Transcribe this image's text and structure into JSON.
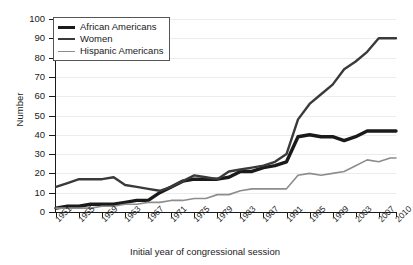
{
  "chart_data": {
    "type": "line",
    "title": "",
    "xlabel": "Initial year of congressional session",
    "ylabel": "Number",
    "xlim": [
      1951,
      2010
    ],
    "ylim": [
      0,
      100
    ],
    "grid": true,
    "legend_position": "top-left",
    "ytick_labels": [
      "0",
      "10",
      "20",
      "30",
      "40",
      "50",
      "60",
      "70",
      "80",
      "90",
      "100"
    ],
    "ytick_values": [
      0,
      10,
      20,
      30,
      40,
      50,
      60,
      70,
      80,
      90,
      100
    ],
    "xtick_labels": [
      "1951",
      "1955",
      "1959",
      "1963",
      "1967",
      "1971",
      "1975",
      "1979",
      "1983",
      "1987",
      "1991",
      "1995",
      "1999",
      "2003",
      "2007",
      "2010"
    ],
    "xtick_values": [
      1951,
      1955,
      1959,
      1963,
      1967,
      1971,
      1975,
      1979,
      1983,
      1987,
      1991,
      1995,
      1999,
      2003,
      2007,
      2010
    ],
    "x": [
      1951,
      1953,
      1955,
      1957,
      1959,
      1961,
      1963,
      1965,
      1967,
      1969,
      1971,
      1973,
      1975,
      1977,
      1979,
      1981,
      1983,
      1985,
      1987,
      1989,
      1991,
      1993,
      1995,
      1997,
      1999,
      2001,
      2003,
      2005,
      2007,
      2009,
      2010
    ],
    "series": [
      {
        "name": "African Americans",
        "color": "#1a1a1a",
        "width": 3.4,
        "values": [
          2,
          3,
          3,
          4,
          4,
          4,
          5,
          6,
          6,
          10,
          13,
          16,
          17,
          17,
          17,
          18,
          21,
          21,
          23,
          24,
          26,
          39,
          40,
          39,
          39,
          37,
          39,
          42,
          42,
          42,
          42
        ]
      },
      {
        "name": "Women",
        "color": "#3a3a3a",
        "width": 2.4,
        "values": [
          13,
          15,
          17,
          17,
          17,
          18,
          14,
          13,
          12,
          11,
          13,
          16,
          19,
          18,
          17,
          21,
          22,
          23,
          24,
          26,
          30,
          48,
          56,
          61,
          66,
          74,
          78,
          83,
          90,
          90,
          90
        ]
      },
      {
        "name": "Hispanic Americans",
        "color": "#8d8d8d",
        "width": 1.6,
        "values": [
          2,
          2,
          2,
          2,
          3,
          3,
          4,
          4,
          5,
          5,
          6,
          6,
          7,
          7,
          9,
          9,
          11,
          12,
          12,
          12,
          12,
          19,
          20,
          19,
          20,
          21,
          24,
          27,
          26,
          28,
          28
        ]
      }
    ]
  }
}
